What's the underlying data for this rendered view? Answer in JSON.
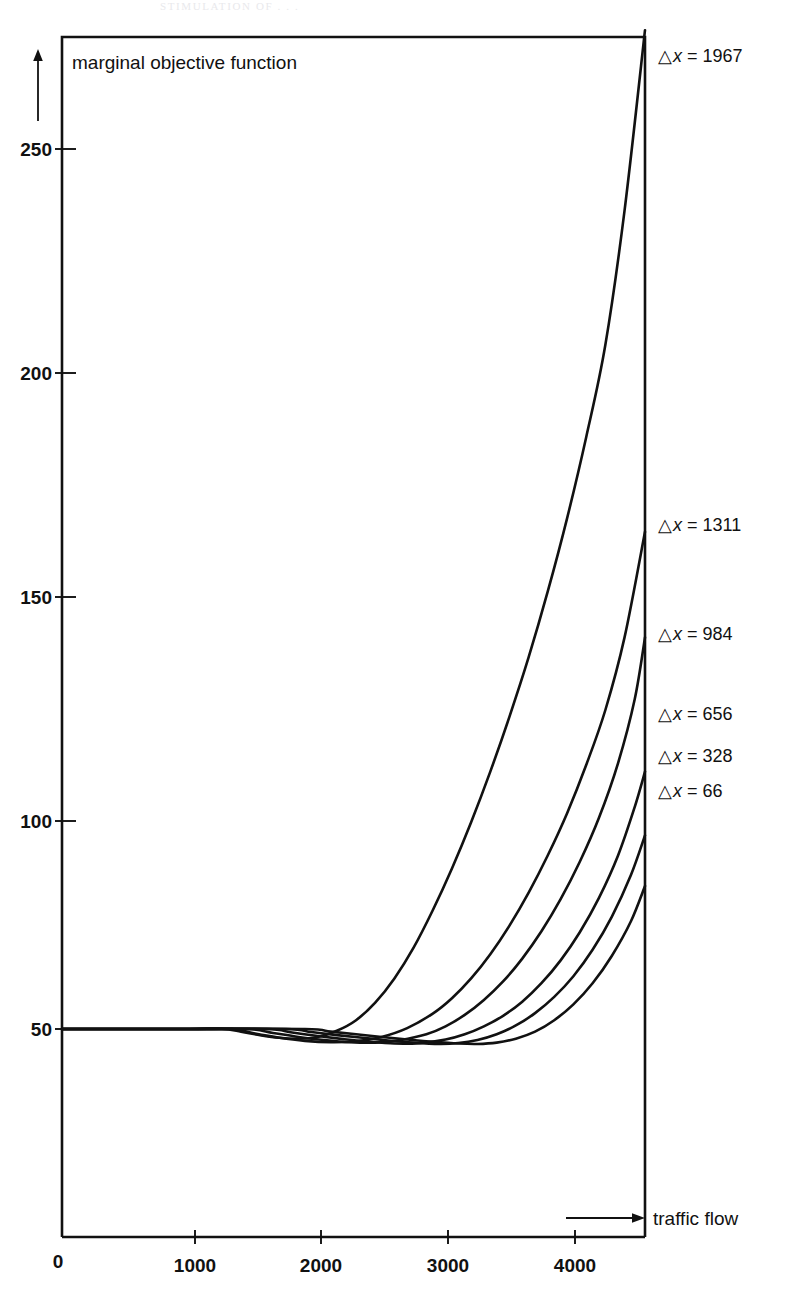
{
  "page": {
    "background_color": "#ffffff",
    "ink_color": "#111111",
    "faint_top_header": "STIMULATION OF  .  .  ."
  },
  "chart_data": {
    "type": "line",
    "title": "",
    "xlabel": "traffic flow",
    "ylabel": "marginal objective function",
    "xlim": [
      0,
      4560
    ],
    "ylim": [
      0,
      277
    ],
    "xticks": [
      0,
      1000,
      2000,
      3000,
      4000
    ],
    "xticklabels": [
      "0",
      "1000",
      "2000",
      "3000",
      "4000"
    ],
    "yticks": [
      50,
      100,
      150,
      200,
      250
    ],
    "yticklabels": [
      "50",
      "100",
      "150",
      "200",
      "250"
    ],
    "grid": false,
    "legend_position": "right-inline-annotations",
    "baseline_value": 50,
    "series": [
      {
        "name": "dx_1967",
        "label_prefix": "△",
        "label_var": "x",
        "label_eq": "=",
        "label_value": "1967",
        "label_x": 658,
        "label_y": 62,
        "points": [
          [
            0,
            50
          ],
          [
            500,
            50
          ],
          [
            1000,
            50
          ],
          [
            1250,
            50
          ],
          [
            1400,
            49.4
          ],
          [
            1550,
            48.6
          ],
          [
            1700,
            48.0
          ],
          [
            1850,
            47.8
          ],
          [
            2000,
            48.2
          ],
          [
            2150,
            49.6
          ],
          [
            2300,
            52.0
          ],
          [
            2450,
            56.0
          ],
          [
            2600,
            61.5
          ],
          [
            2750,
            68.5
          ],
          [
            2900,
            77.0
          ],
          [
            3050,
            86.5
          ],
          [
            3200,
            97.0
          ],
          [
            3350,
            108.5
          ],
          [
            3500,
            121.0
          ],
          [
            3650,
            134.5
          ],
          [
            3800,
            149.5
          ],
          [
            3950,
            166.0
          ],
          [
            4100,
            184.5
          ],
          [
            4250,
            205.5
          ],
          [
            4400,
            236.0
          ],
          [
            4560,
            277.0
          ]
        ]
      },
      {
        "name": "dx_1311",
        "label_prefix": "△",
        "label_var": "x",
        "label_eq": "=",
        "label_value": "1311",
        "label_x": 658,
        "label_y": 531,
        "points": [
          [
            0,
            50
          ],
          [
            500,
            50
          ],
          [
            1000,
            50
          ],
          [
            1330,
            50
          ],
          [
            1500,
            49.0
          ],
          [
            1700,
            48.0
          ],
          [
            1900,
            47.3
          ],
          [
            2100,
            47.0
          ],
          [
            2300,
            47.2
          ],
          [
            2500,
            48.2
          ],
          [
            2700,
            50.2
          ],
          [
            2900,
            53.5
          ],
          [
            3050,
            57.0
          ],
          [
            3200,
            61.5
          ],
          [
            3350,
            67.0
          ],
          [
            3500,
            73.5
          ],
          [
            3650,
            81.0
          ],
          [
            3800,
            89.5
          ],
          [
            3950,
            99.0
          ],
          [
            4100,
            110.0
          ],
          [
            4250,
            122.5
          ],
          [
            4400,
            139.0
          ],
          [
            4560,
            163.0
          ]
        ]
      },
      {
        "name": "dx_984",
        "label_prefix": "△",
        "label_var": "x",
        "label_eq": "=",
        "label_value": "984",
        "label_x": 658,
        "label_y": 640,
        "points": [
          [
            0,
            50
          ],
          [
            500,
            50
          ],
          [
            1000,
            50
          ],
          [
            1450,
            50
          ],
          [
            1650,
            49.1
          ],
          [
            1850,
            48.2
          ],
          [
            2050,
            47.5
          ],
          [
            2250,
            47.0
          ],
          [
            2450,
            46.9
          ],
          [
            2650,
            47.5
          ],
          [
            2850,
            48.8
          ],
          [
            3000,
            50.6
          ],
          [
            3150,
            53.2
          ],
          [
            3300,
            56.6
          ],
          [
            3450,
            60.8
          ],
          [
            3600,
            66.0
          ],
          [
            3750,
            72.2
          ],
          [
            3900,
            79.5
          ],
          [
            4050,
            88.0
          ],
          [
            4200,
            98.0
          ],
          [
            4350,
            110.5
          ],
          [
            4480,
            125.0
          ],
          [
            4560,
            139.0
          ]
        ]
      },
      {
        "name": "dx_656",
        "label_prefix": "△",
        "label_var": "x",
        "label_eq": "=",
        "label_value": "656",
        "label_x": 658,
        "label_y": 720,
        "points": [
          [
            0,
            50
          ],
          [
            500,
            50
          ],
          [
            1000,
            50
          ],
          [
            1600,
            50
          ],
          [
            1800,
            49.2
          ],
          [
            2000,
            48.4
          ],
          [
            2200,
            47.7
          ],
          [
            2400,
            47.1
          ],
          [
            2600,
            46.7
          ],
          [
            2800,
            46.8
          ],
          [
            3000,
            47.6
          ],
          [
            3150,
            48.8
          ],
          [
            3300,
            50.6
          ],
          [
            3450,
            53.0
          ],
          [
            3600,
            56.2
          ],
          [
            3750,
            60.4
          ],
          [
            3900,
            65.6
          ],
          [
            4050,
            72.0
          ],
          [
            4200,
            79.8
          ],
          [
            4350,
            89.5
          ],
          [
            4480,
            100.5
          ],
          [
            4560,
            108.5
          ]
        ]
      },
      {
        "name": "dx_328",
        "label_prefix": "△",
        "label_var": "x",
        "label_eq": "=",
        "label_value": "328",
        "label_x": 658,
        "label_y": 762,
        "points": [
          [
            0,
            50
          ],
          [
            500,
            50
          ],
          [
            1000,
            50
          ],
          [
            1750,
            50
          ],
          [
            1950,
            49.3
          ],
          [
            2150,
            48.6
          ],
          [
            2350,
            48.0
          ],
          [
            2550,
            47.4
          ],
          [
            2750,
            46.9
          ],
          [
            2950,
            46.6
          ],
          [
            3100,
            46.8
          ],
          [
            3250,
            47.5
          ],
          [
            3400,
            48.8
          ],
          [
            3550,
            50.8
          ],
          [
            3700,
            53.6
          ],
          [
            3850,
            57.3
          ],
          [
            4000,
            62.0
          ],
          [
            4150,
            68.0
          ],
          [
            4300,
            75.5
          ],
          [
            4450,
            85.0
          ],
          [
            4560,
            94.0
          ]
        ]
      },
      {
        "name": "dx_66",
        "label_prefix": "△",
        "label_var": "x",
        "label_eq": "=",
        "label_value": "66",
        "label_x": 658,
        "label_y": 797,
        "points": [
          [
            0,
            50
          ],
          [
            500,
            50
          ],
          [
            1000,
            50
          ],
          [
            1900,
            50
          ],
          [
            2100,
            49.4
          ],
          [
            2300,
            48.8
          ],
          [
            2500,
            48.2
          ],
          [
            2700,
            47.6
          ],
          [
            2900,
            47.1
          ],
          [
            3100,
            46.7
          ],
          [
            3250,
            46.6
          ],
          [
            3400,
            46.9
          ],
          [
            3550,
            47.8
          ],
          [
            3700,
            49.4
          ],
          [
            3850,
            52.0
          ],
          [
            4000,
            55.6
          ],
          [
            4150,
            60.4
          ],
          [
            4300,
            66.6
          ],
          [
            4450,
            74.5
          ],
          [
            4560,
            82.5
          ]
        ]
      }
    ]
  }
}
